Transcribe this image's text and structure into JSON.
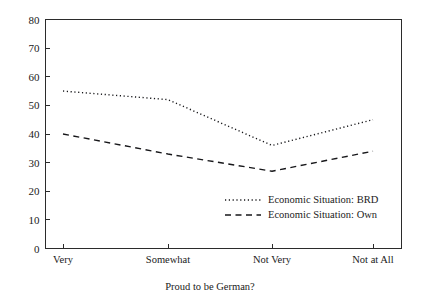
{
  "chart_data": {
    "type": "line",
    "title": "",
    "subtitle": "",
    "xlabel": "Proud to be German?",
    "ylabel": "",
    "categories": [
      "Very",
      "Somewhat",
      "Not Very",
      "Not at All"
    ],
    "series": [
      {
        "name": "Economic Situation: BRD",
        "style": "dotted",
        "color": "#17171a",
        "values": [
          55,
          52,
          36,
          45
        ]
      },
      {
        "name": "Economic Situation: Own",
        "style": "dashed",
        "color": "#17171a",
        "values": [
          40,
          33,
          27,
          34
        ]
      }
    ],
    "ylim": [
      0,
      80
    ],
    "yticks": [
      0,
      10,
      20,
      30,
      40,
      50,
      60,
      70,
      80
    ],
    "ytick_labels": [
      "0",
      "10",
      "20",
      "30",
      "40",
      "50",
      "60",
      "70",
      "80"
    ],
    "grid": false,
    "legend_position": "inside-lower-right",
    "background": "#ffffff",
    "axis_color": "#2b2b2b"
  },
  "axis": {
    "y_ticks": [
      {
        "value": 80,
        "label": "80"
      },
      {
        "value": 70,
        "label": "70"
      },
      {
        "value": 60,
        "label": "60"
      },
      {
        "value": 50,
        "label": "50"
      },
      {
        "value": 40,
        "label": "40"
      },
      {
        "value": 30,
        "label": "30"
      },
      {
        "value": 20,
        "label": "20"
      },
      {
        "value": 10,
        "label": "10"
      },
      {
        "value": 0,
        "label": "0"
      }
    ],
    "x_categories": [
      {
        "label": "Very"
      },
      {
        "label": "Somewhat"
      },
      {
        "label": "Not Very"
      },
      {
        "label": "Not at All"
      }
    ],
    "x_title": "Proud to be German?"
  },
  "legend": {
    "entries": [
      {
        "label": "Economic Situation: BRD",
        "style": "dotted"
      },
      {
        "label": "Economic Situation: Own",
        "style": "dashed"
      }
    ]
  }
}
